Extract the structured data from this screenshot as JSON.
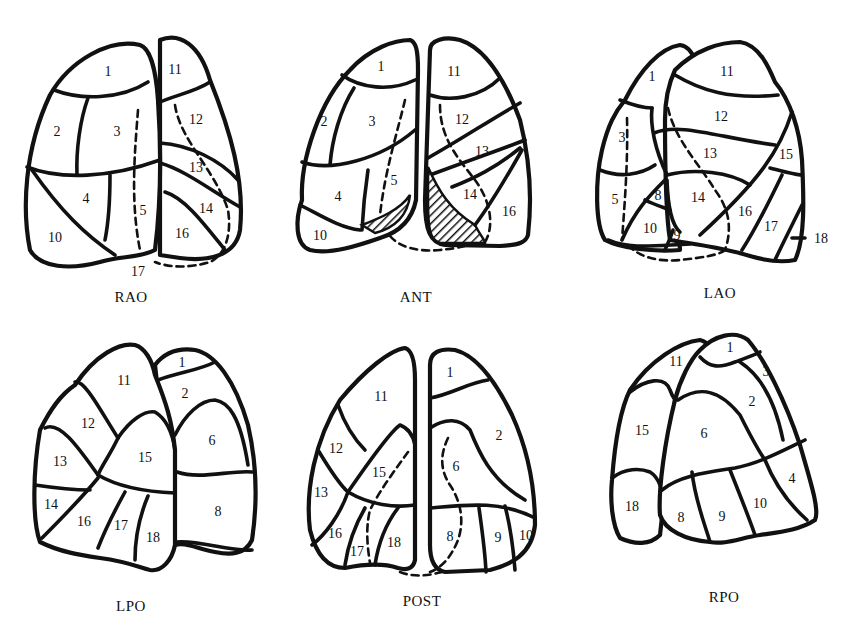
{
  "figure": {
    "colors": {
      "line": "#111111",
      "background": "#ffffff"
    }
  },
  "views": {
    "rao": {
      "caption": "RAO",
      "segments": {
        "s1": "1",
        "s2": "2",
        "s3": "3",
        "s4": "4",
        "s5": "5",
        "s10": "10",
        "s11": "11",
        "s12": "12",
        "s13": "13",
        "s14": "14",
        "s16": "16",
        "s17": "17"
      }
    },
    "ant": {
      "caption": "ANT",
      "segments": {
        "s1": "1",
        "s2": "2",
        "s3": "3",
        "s4": "4",
        "s5": "5",
        "s10": "10",
        "s11": "11",
        "s12": "12",
        "s13": "13",
        "s14": "14",
        "s16": "16"
      }
    },
    "lao": {
      "caption": "LAO",
      "segments": {
        "s1": "1",
        "s3": "3",
        "s5": "5",
        "s8": "8",
        "s9": "9",
        "s10": "10",
        "s11": "11",
        "s12": "12",
        "s13": "13",
        "s14": "14",
        "s15": "15",
        "s16": "16",
        "s17": "17",
        "s18": "18"
      }
    },
    "lpo": {
      "caption": "LPO",
      "segments": {
        "s1": "1",
        "s2": "2",
        "s6": "6",
        "s8": "8",
        "s11": "11",
        "s12": "12",
        "s13": "13",
        "s14": "14",
        "s15": "15",
        "s16": "16",
        "s17": "17",
        "s18": "18"
      }
    },
    "post": {
      "caption": "POST",
      "segments": {
        "s1": "1",
        "s2": "2",
        "s6": "6",
        "s8": "8",
        "s9": "9",
        "s10": "10",
        "s11": "11",
        "s12": "12",
        "s13": "13",
        "s15": "15",
        "s16": "16",
        "s17": "17",
        "s18": "18"
      }
    },
    "rpo": {
      "caption": "RPO",
      "segments": {
        "s1": "1",
        "s2": "2",
        "s3": "3",
        "s4": "4",
        "s6": "6",
        "s8": "8",
        "s9": "9",
        "s10": "10",
        "s11": "11",
        "s15": "15",
        "s18": "18"
      }
    }
  }
}
